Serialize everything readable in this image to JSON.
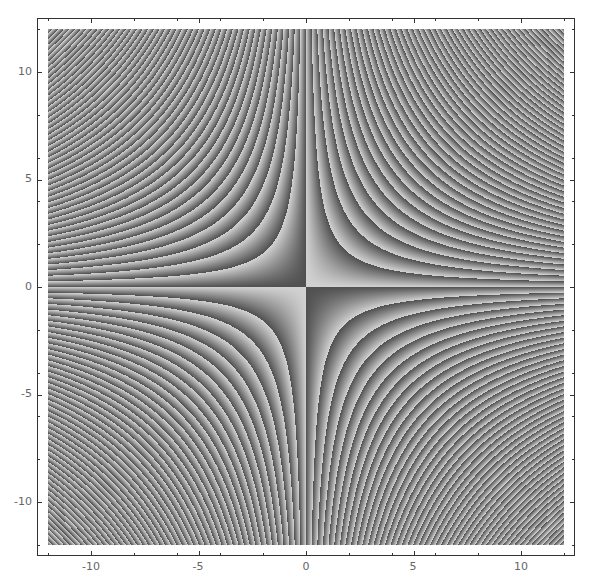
{
  "chart_data": {
    "type": "heatmap",
    "title": "",
    "xlabel": "",
    "ylabel": "",
    "function": "1 - frac(x*y/pi)  (sawtooth phase of x*y, grayscale)",
    "xlim": [
      -12,
      12
    ],
    "ylim": [
      -12,
      12
    ],
    "x_ticks": [
      -10,
      -5,
      0,
      5,
      10
    ],
    "y_ticks": [
      -10,
      -5,
      0,
      5,
      10
    ],
    "x_tick_labels": [
      "-10",
      "-5",
      "0",
      "5",
      "10"
    ],
    "y_tick_labels": [
      "10",
      "5",
      "0",
      "-5",
      "-10"
    ],
    "period": 3.14159,
    "colormap": {
      "dark": "#505050",
      "light": "#d2d2d2"
    },
    "grid": false,
    "legend": null
  },
  "axes": {
    "x_labels": [
      "-10",
      "-5",
      "0",
      "5",
      "10"
    ],
    "y_labels": [
      "10",
      "5",
      "0",
      "-5",
      "-10"
    ]
  }
}
